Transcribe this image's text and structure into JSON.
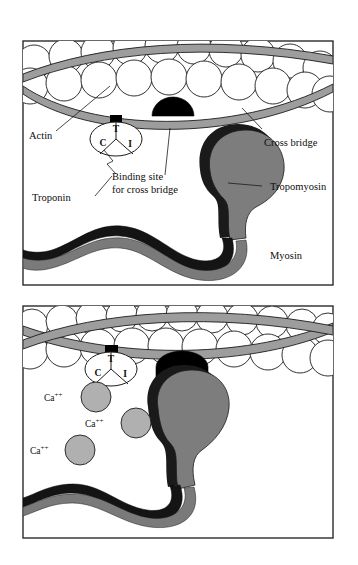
{
  "figure": {
    "panel_count": 2
  },
  "colors": {
    "background": "#ffffff",
    "outline": "#1c1c1c",
    "frame_stroke": "#2b2b2b",
    "actin_bead_fill": "#ffffff",
    "tropomyosin_gray": "#9d9d9d",
    "myosin_head_gray": "#7d7d7d",
    "myosin_head_dark": "#1a1a1a",
    "myosin_tail_dark": "#141414",
    "myosin_tail_gray": "#7a7a7a",
    "binding_site_black": "#000000",
    "calcium_ion_gray": "#b0b0b0",
    "text": "#0d0d0d"
  },
  "panel_top": {
    "name": "relaxed-state-panel",
    "labels": {
      "actin": "Actin",
      "troponin": "Troponin",
      "binding_site_line1": "Binding site",
      "binding_site_line2": "for cross bridge",
      "cross_bridge": "Cross bridge",
      "tropomyosin": "Tropomyosin",
      "myosin": "Myosin"
    },
    "troponin_subunits": {
      "c": "C",
      "t": "T",
      "i": "I"
    },
    "actin_bead_count": 22,
    "tropomyosin_strand_count": 2
  },
  "panel_bottom": {
    "name": "calcium-bound-state-panel",
    "calcium_labels": [
      {
        "base": "Ca",
        "charge": "++"
      },
      {
        "base": "Ca",
        "charge": "++"
      },
      {
        "base": "Ca",
        "charge": "++"
      }
    ],
    "troponin_subunits": {
      "c": "C",
      "t": "T",
      "i": "I"
    },
    "calcium_ion_count": 3,
    "actin_bead_count": 22,
    "tropomyosin_strand_count": 2
  }
}
